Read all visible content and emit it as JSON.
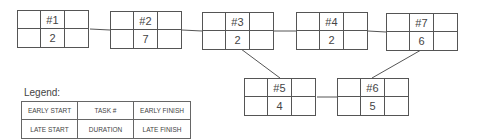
{
  "diagram": {
    "type": "project-network-activity-on-node",
    "nodes": [
      {
        "id": "n1",
        "task": "#1",
        "duration": "2",
        "early_start": "",
        "early_finish": "",
        "late_start": "",
        "late_finish": ""
      },
      {
        "id": "n2",
        "task": "#2",
        "duration": "7",
        "early_start": "",
        "early_finish": "",
        "late_start": "",
        "late_finish": ""
      },
      {
        "id": "n3",
        "task": "#3",
        "duration": "2",
        "early_start": "",
        "early_finish": "",
        "late_start": "",
        "late_finish": ""
      },
      {
        "id": "n4",
        "task": "#4",
        "duration": "2",
        "early_start": "",
        "early_finish": "",
        "late_start": "",
        "late_finish": ""
      },
      {
        "id": "n7",
        "task": "#7",
        "duration": "6",
        "early_start": "",
        "early_finish": "",
        "late_start": "",
        "late_finish": ""
      },
      {
        "id": "n5",
        "task": "#5",
        "duration": "4",
        "early_start": "",
        "early_finish": "",
        "late_start": "",
        "late_finish": ""
      },
      {
        "id": "n6",
        "task": "#6",
        "duration": "5",
        "early_start": "",
        "early_finish": "",
        "late_start": "",
        "late_finish": ""
      }
    ],
    "edges": [
      {
        "from": "#1",
        "to": "#2"
      },
      {
        "from": "#2",
        "to": "#3"
      },
      {
        "from": "#3",
        "to": "#4"
      },
      {
        "from": "#4",
        "to": "#7"
      },
      {
        "from": "#3",
        "to": "#5"
      },
      {
        "from": "#5",
        "to": "#6"
      },
      {
        "from": "#6",
        "to": "#7"
      }
    ]
  },
  "legend": {
    "title": "Legend:",
    "cells": [
      "EARLY START",
      "TASK #",
      "EARLY FINISH",
      "LATE START",
      "DURATION",
      "LATE FINISH"
    ]
  }
}
